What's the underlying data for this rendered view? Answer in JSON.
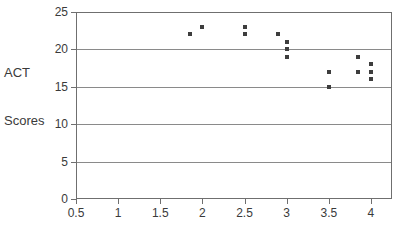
{
  "chart_data": {
    "type": "scatter",
    "title": "",
    "xlabel": "",
    "ylabel": "ACT Scores",
    "ylabel_lines": [
      "ACT",
      "Scores"
    ],
    "xlim": [
      0.5,
      4.25
    ],
    "ylim": [
      0,
      25
    ],
    "grid": true,
    "legend": "none",
    "y_ticks": [
      0,
      5,
      10,
      15,
      20,
      25
    ],
    "y_tick_labels": [
      "0",
      "5",
      "10",
      "15",
      "20",
      "25"
    ],
    "x_ticks": [
      0.5,
      1,
      1.5,
      2,
      2.5,
      3,
      3.5,
      4
    ],
    "x_tick_labels": [
      "0.5",
      "1",
      "1.5",
      "2",
      "2.5",
      "3",
      "3.5",
      "4"
    ],
    "marker_color": "#3d3d3d",
    "grid_color": "#8a8a8a",
    "frame_color": "#6f6f6f",
    "points": [
      {
        "x": 1.85,
        "y": 22
      },
      {
        "x": 2.0,
        "y": 23
      },
      {
        "x": 2.5,
        "y": 23
      },
      {
        "x": 2.5,
        "y": 22
      },
      {
        "x": 2.9,
        "y": 22
      },
      {
        "x": 3.0,
        "y": 21
      },
      {
        "x": 3.0,
        "y": 20
      },
      {
        "x": 3.0,
        "y": 19
      },
      {
        "x": 3.5,
        "y": 17
      },
      {
        "x": 3.5,
        "y": 15
      },
      {
        "x": 3.85,
        "y": 19
      },
      {
        "x": 3.85,
        "y": 17
      },
      {
        "x": 4.0,
        "y": 18
      },
      {
        "x": 4.0,
        "y": 17
      },
      {
        "x": 4.0,
        "y": 16
      }
    ],
    "x_axis_caption_clipped": ""
  }
}
